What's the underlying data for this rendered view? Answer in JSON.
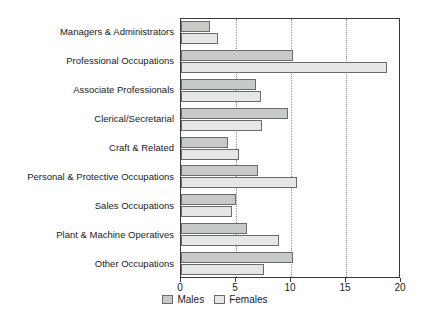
{
  "chart_data": {
    "type": "bar",
    "orientation": "horizontal",
    "title": "",
    "xlabel": "",
    "ylabel": "",
    "xlim": [
      0,
      20
    ],
    "xticks": [
      0,
      5,
      10,
      15,
      20
    ],
    "xtick_labels": [
      "0",
      "5",
      "10",
      "15",
      "20"
    ],
    "gridlines": [
      5,
      10,
      15
    ],
    "grid": true,
    "grid_style": "dotted",
    "legend_position": "bottom-center",
    "categories": [
      "Managers & Administrators",
      "Professional Occupations",
      "Associate Professionals",
      "Clerical/Secretarial",
      "Craft & Related",
      "Personal & Protective Occupations",
      "Sales Occupations",
      "Plant & Machine Operatives",
      "Other Occupations"
    ],
    "series": [
      {
        "name": "Males",
        "color": "#c6cbc8",
        "values": [
          2.6,
          10.2,
          6.8,
          9.7,
          4.3,
          7.0,
          5.0,
          6.0,
          10.2
        ]
      },
      {
        "name": "Females",
        "color": "#e4e7e5",
        "values": [
          3.4,
          18.7,
          7.3,
          7.4,
          5.3,
          10.5,
          4.6,
          8.9,
          7.5
        ]
      }
    ]
  },
  "legend": {
    "items": [
      {
        "label": "Males",
        "swatch": "males"
      },
      {
        "label": "Females",
        "swatch": "females"
      }
    ]
  },
  "colors": {
    "males_fill": "#c6cbc8",
    "females_fill": "#e4e7e5",
    "bar_outline": "#6b6b6b",
    "frame": "#3a3a3a",
    "gridline": "#8f8f8f",
    "text": "#1a1a1a",
    "background": "#ffffff"
  }
}
